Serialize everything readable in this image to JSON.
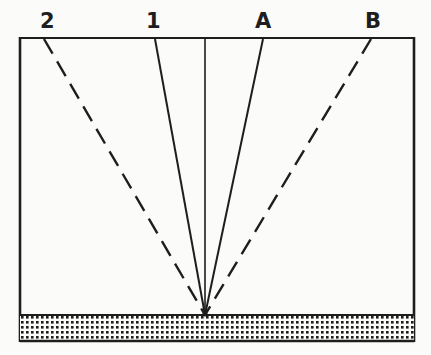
{
  "diagram": {
    "labels": [
      {
        "id": "ray-2",
        "text": "2",
        "x": 48,
        "y": 27
      },
      {
        "id": "ray-1",
        "text": "1",
        "x": 153,
        "y": 27
      },
      {
        "id": "ray-a",
        "text": "A",
        "x": 263,
        "y": 27
      },
      {
        "id": "ray-b",
        "text": "B",
        "x": 373,
        "y": 27
      }
    ],
    "rays": [
      {
        "id": "ray-2",
        "style": "dashed",
        "x1": 44,
        "y1": 39
      },
      {
        "id": "ray-1",
        "style": "solid",
        "x1": 155,
        "y1": 39
      },
      {
        "id": "normal",
        "style": "solid",
        "x1": 205,
        "y1": 39
      },
      {
        "id": "ray-a",
        "style": "solid",
        "x1": 263,
        "y1": 39
      },
      {
        "id": "ray-b",
        "style": "dashed",
        "x1": 371,
        "y1": 39
      }
    ],
    "convergence_point": {
      "x": 205,
      "y": 315
    },
    "colors": {
      "ink": "#1e1e1e",
      "background": "#fbfbfa"
    }
  }
}
